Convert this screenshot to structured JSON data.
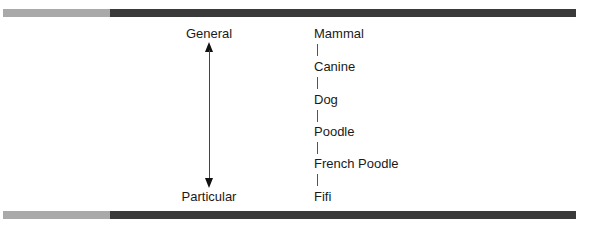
{
  "axis": {
    "top_label": "General",
    "bottom_label": "Particular",
    "icon": "double-arrow-vertical-icon"
  },
  "hierarchy": {
    "nodes": [
      {
        "label": "Mammal"
      },
      {
        "label": "Canine"
      },
      {
        "label": "Dog"
      },
      {
        "label": "Poodle"
      },
      {
        "label": "French Poodle"
      },
      {
        "label": "Fifi"
      }
    ]
  },
  "colors": {
    "bar_light": "#a9a9a9",
    "bar_dark": "#3a3a3a",
    "text": "#1a1a1a"
  }
}
